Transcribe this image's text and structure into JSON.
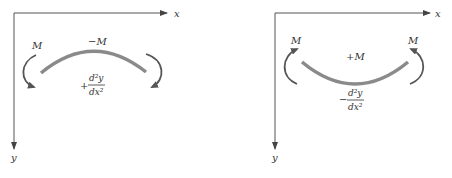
{
  "colors": {
    "axis": "#555555",
    "beam": "#8a8a8a",
    "moment_arrow": "#555555",
    "text": "#333333"
  },
  "left_panel": {
    "axis_x_label": "x",
    "axis_y_label": "y",
    "beam_moment_label": "−M",
    "end_moment_label": "M",
    "curvature_sign": "+",
    "curvature_numerator": "d²y",
    "curvature_denominator": "dx²",
    "beam_shape": "concave down (hogging)"
  },
  "right_panel": {
    "axis_x_label": "x",
    "axis_y_label": "y",
    "beam_moment_label": "+M",
    "left_end_moment_label": "M",
    "right_end_moment_label": "M",
    "curvature_sign": "−",
    "curvature_numerator": "d²y",
    "curvature_denominator": "dx²",
    "beam_shape": "concave up (sagging)"
  }
}
